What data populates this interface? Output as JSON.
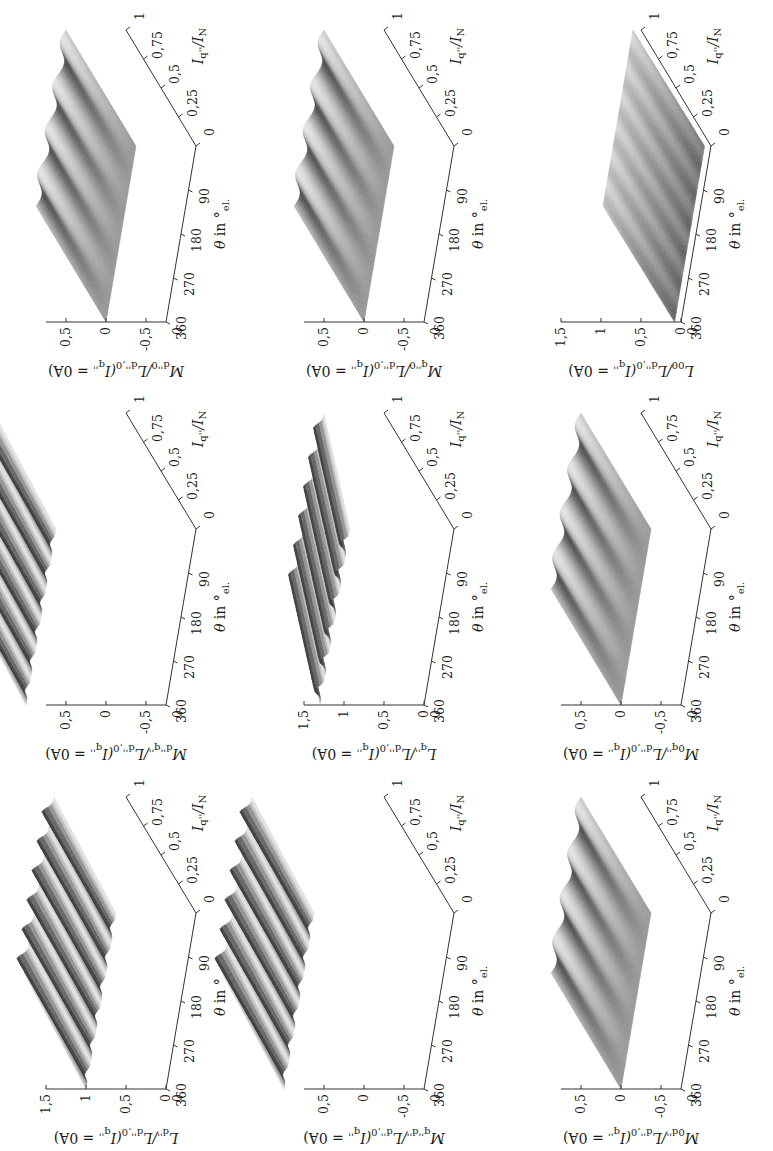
{
  "figure": {
    "orientation": "rotated 90 degrees counter-clockwise",
    "layout": "3x3 grid of 3D surface plots",
    "colormap": "grayscale",
    "axes_common": {
      "theta_label": "θ in °el.",
      "theta_ticks": [
        "90",
        "180",
        "270",
        "360"
      ],
      "current_label": "Iq''/IN",
      "current_ticks": [
        "0",
        "0,25",
        "0,5",
        "0,75",
        "1"
      ]
    }
  },
  "panels": [
    {
      "id": "Ldd",
      "zlabel": "Ld''/Ld'',0(Iq'' = 0A)",
      "zlabel_main": "L",
      "zlabel_sub": "d''",
      "zlabel_rest": "/L",
      "zlabel_sub2": "d'',0",
      "zlabel_tail": "(I",
      "zlabel_sub3": "q''",
      "zlabel_end": " = 0A)",
      "zticks": [
        "0",
        "0,5",
        "1",
        "1,5"
      ],
      "zrange": [
        0,
        1.5
      ],
      "style": "ridged"
    },
    {
      "id": "Mdq",
      "zlabel": "Md''q''/Ld'',0(Iq'' = 0A)",
      "zlabel_main": "M",
      "zlabel_sub": "d''q''",
      "zlabel_rest": "/L",
      "zlabel_sub2": "d'',0",
      "zlabel_tail": "(I",
      "zlabel_sub3": "q''",
      "zlabel_end": " = 0A)",
      "zticks": [
        "-0,5",
        "0",
        "0,5"
      ],
      "zrange": [
        -0.75,
        0.75
      ],
      "style": "ridged"
    },
    {
      "id": "Md0",
      "zlabel": "Md''0/Ld'',0(Iq'' = 0A)",
      "zlabel_main": "M",
      "zlabel_sub": "d''0",
      "zlabel_rest": "/L",
      "zlabel_sub2": "d'',0",
      "zlabel_tail": "(I",
      "zlabel_sub3": "q''",
      "zlabel_end": " = 0A)",
      "zticks": [
        "-0,5",
        "0",
        "0,5"
      ],
      "zrange": [
        -0.75,
        0.75
      ],
      "style": "flat-wavy"
    },
    {
      "id": "Mqd",
      "zlabel": "Mq''d''/Ld'',0(Iq'' = 0A)",
      "zlabel_main": "M",
      "zlabel_sub": "q''d''",
      "zlabel_rest": "/L",
      "zlabel_sub2": "d'',0",
      "zlabel_tail": "(I",
      "zlabel_sub3": "q''",
      "zlabel_end": " = 0A)",
      "zticks": [
        "-0,5",
        "0",
        "0,5"
      ],
      "zrange": [
        -0.75,
        0.75
      ],
      "style": "ridged"
    },
    {
      "id": "Lqq",
      "zlabel": "Lq''/Ld'',0(Iq'' = 0A)",
      "zlabel_main": "L",
      "zlabel_sub": "q''",
      "zlabel_rest": "/L",
      "zlabel_sub2": "d'',0",
      "zlabel_tail": "(I",
      "zlabel_sub3": "q''",
      "zlabel_end": " = 0A)",
      "zticks": [
        "0",
        "0,5",
        "1",
        "1,5"
      ],
      "zrange": [
        0,
        1.5
      ],
      "style": "ridged-decay"
    },
    {
      "id": "Mq0",
      "zlabel": "Mq''0/Ld'',0(Iq'' = 0A)",
      "zlabel_main": "M",
      "zlabel_sub": "q''0",
      "zlabel_rest": "/L",
      "zlabel_sub2": "d'',0",
      "zlabel_tail": "(I",
      "zlabel_sub3": "q''",
      "zlabel_end": " = 0A)",
      "zticks": [
        "-0,5",
        "0",
        "0,5"
      ],
      "zrange": [
        -0.75,
        0.75
      ],
      "style": "flat-wavy"
    },
    {
      "id": "M0d",
      "zlabel": "M0d''/Ld'',0(Iq'' = 0A)",
      "zlabel_main": "M",
      "zlabel_sub": "0d''",
      "zlabel_rest": "/L",
      "zlabel_sub2": "d'',0",
      "zlabel_tail": "(I",
      "zlabel_sub3": "q''",
      "zlabel_end": " = 0A)",
      "zticks": [
        "-0,5",
        "0",
        "0,5"
      ],
      "zrange": [
        -0.75,
        0.75
      ],
      "style": "flat-wavy"
    },
    {
      "id": "M0q",
      "zlabel": "M0q''/Ld'',0(Iq'' = 0A)",
      "zlabel_main": "M",
      "zlabel_sub": "0q''",
      "zlabel_rest": "/L",
      "zlabel_sub2": "d'',0",
      "zlabel_tail": "(I",
      "zlabel_sub3": "q''",
      "zlabel_end": " = 0A)",
      "zticks": [
        "-0,5",
        "0",
        "0,5"
      ],
      "zrange": [
        -0.75,
        0.75
      ],
      "style": "flat-wavy"
    },
    {
      "id": "L00",
      "zlabel": "L00/Ld'',0(Iq'' = 0A)",
      "zlabel_main": "L",
      "zlabel_sub": "00",
      "zlabel_rest": "/L",
      "zlabel_sub2": "d'',0",
      "zlabel_tail": "(I",
      "zlabel_sub3": "q''",
      "zlabel_end": " = 0A)",
      "zticks": [
        "0",
        "0,5",
        "1",
        "1,5"
      ],
      "zrange": [
        0,
        1.5
      ],
      "style": "flat-low"
    }
  ],
  "chart_data": [
    {
      "type": "surface",
      "title": "",
      "zlabel": "Ld''/Ld'',0(Iq'' = 0A)",
      "xlabel": "θ in °el.",
      "ylabel": "Iq''/IN",
      "x_ticks": [
        90,
        180,
        270,
        360
      ],
      "y_ticks": [
        0,
        0.25,
        0.5,
        0.75,
        1
      ],
      "z_ticks": [
        0,
        0.5,
        1,
        1.5
      ],
      "zlim": [
        0,
        1.5
      ],
      "description": "surface near 1.0 with 6 periodic ridges along θ, slight decrease with Iq''"
    },
    {
      "type": "surface",
      "title": "",
      "zlabel": "Md''q''/Ld'',0(Iq'' = 0A)",
      "xlabel": "θ in °el.",
      "ylabel": "Iq''/IN",
      "x_ticks": [
        90,
        180,
        270,
        360
      ],
      "y_ticks": [
        0,
        0.25,
        0.5,
        0.75,
        1
      ],
      "z_ticks": [
        -0.5,
        0,
        0.5
      ],
      "zlim": [
        -0.75,
        0.75
      ],
      "description": "near 0, 6 periodic ridges along θ"
    },
    {
      "type": "surface",
      "title": "",
      "zlabel": "Md''0/Ld'',0(Iq'' = 0A)",
      "xlabel": "θ in °el.",
      "ylabel": "Iq''/IN",
      "x_ticks": [
        90,
        180,
        270,
        360
      ],
      "y_ticks": [
        0,
        0.25,
        0.5,
        0.75,
        1
      ],
      "z_ticks": [
        -0.5,
        0,
        0.5
      ],
      "zlim": [
        -0.75,
        0.75
      ],
      "description": "approximately 0, weak waviness growing with Iq''"
    },
    {
      "type": "surface",
      "title": "",
      "zlabel": "Mq''d''/Ld'',0(Iq'' = 0A)",
      "xlabel": "θ in °el.",
      "ylabel": "Iq''/IN",
      "x_ticks": [
        90,
        180,
        270,
        360
      ],
      "y_ticks": [
        0,
        0.25,
        0.5,
        0.75,
        1
      ],
      "z_ticks": [
        -0.5,
        0,
        0.5
      ],
      "zlim": [
        -0.75,
        0.75
      ],
      "description": "near 0, 6 periodic ridges along θ"
    },
    {
      "type": "surface",
      "title": "",
      "zlabel": "Lq''/Ld'',0(Iq'' = 0A)",
      "xlabel": "θ in °el.",
      "ylabel": "Iq''/IN",
      "x_ticks": [
        90,
        180,
        270,
        360
      ],
      "y_ticks": [
        0,
        0.25,
        0.5,
        0.75,
        1
      ],
      "z_ticks": [
        0,
        0.5,
        1,
        1.5
      ],
      "zlim": [
        0,
        1.5
      ],
      "description": "approx. 1.3 at Iq''=0 decreasing with Iq'', 6 periodic ridges along θ"
    },
    {
      "type": "surface",
      "title": "",
      "zlabel": "Mq''0/Ld'',0(Iq'' = 0A)",
      "xlabel": "θ in °el.",
      "ylabel": "Iq''/IN",
      "x_ticks": [
        90,
        180,
        270,
        360
      ],
      "y_ticks": [
        0,
        0.25,
        0.5,
        0.75,
        1
      ],
      "z_ticks": [
        -0.5,
        0,
        0.5
      ],
      "zlim": [
        -0.75,
        0.75
      ],
      "description": "approximately 0, weak waviness"
    },
    {
      "type": "surface",
      "title": "",
      "zlabel": "M0d''/Ld'',0(Iq'' = 0A)",
      "xlabel": "θ in °el.",
      "ylabel": "Iq''/IN",
      "x_ticks": [
        90,
        180,
        270,
        360
      ],
      "y_ticks": [
        0,
        0.25,
        0.5,
        0.75,
        1
      ],
      "z_ticks": [
        -0.5,
        0,
        0.5
      ],
      "zlim": [
        -0.75,
        0.75
      ],
      "description": "approximately 0, weak waviness"
    },
    {
      "type": "surface",
      "title": "",
      "zlabel": "M0q''/Ld'',0(Iq'' = 0A)",
      "xlabel": "θ in °el.",
      "ylabel": "Iq''/IN",
      "x_ticks": [
        90,
        180,
        270,
        360
      ],
      "y_ticks": [
        0,
        0.25,
        0.5,
        0.75,
        1
      ],
      "z_ticks": [
        -0.5,
        0,
        0.5
      ],
      "zlim": [
        -0.75,
        0.75
      ],
      "description": "approximately 0, weak waviness"
    },
    {
      "type": "surface",
      "title": "",
      "zlabel": "L00/Ld'',0(Iq'' = 0A)",
      "xlabel": "θ in °el.",
      "ylabel": "Iq''/IN",
      "x_ticks": [
        90,
        180,
        270,
        360
      ],
      "y_ticks": [
        0,
        0.25,
        0.5,
        0.75,
        1
      ],
      "z_ticks": [
        0,
        0.5,
        1,
        1.5
      ],
      "zlim": [
        0,
        1.5
      ],
      "description": "low nearly flat surface around 0.05-0.1"
    }
  ]
}
